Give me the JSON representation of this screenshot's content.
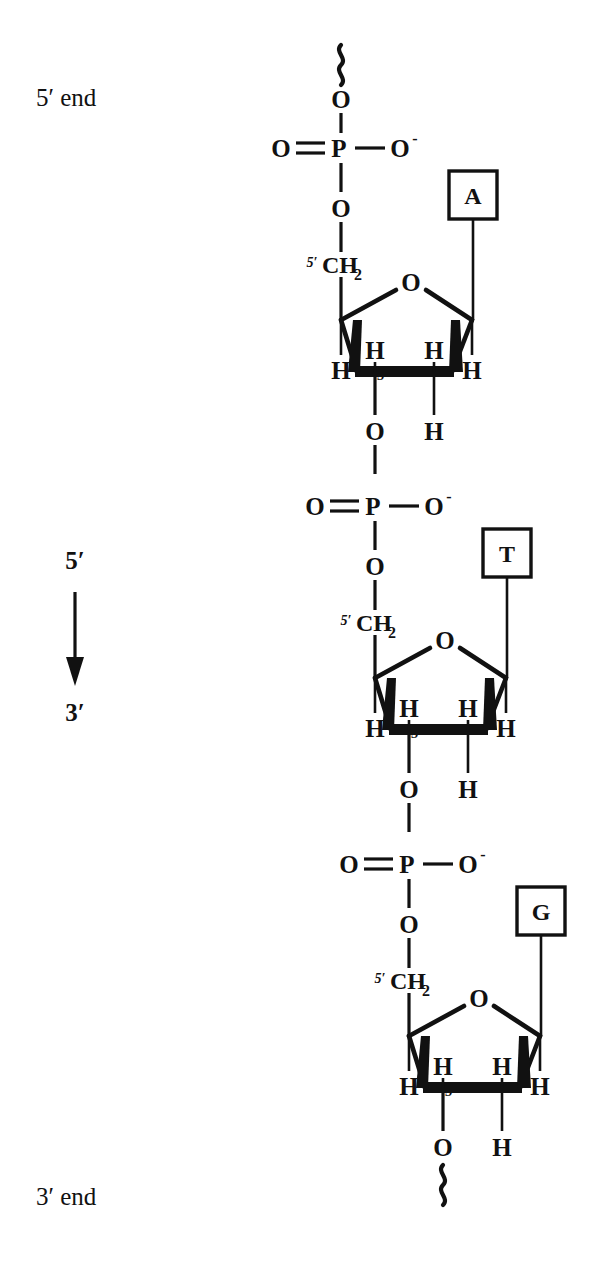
{
  "figure": {
    "kind": "dna-single-strand-backbone-diagram",
    "title_text": "",
    "ink_color": "#111111",
    "background_color": "#ffffff"
  },
  "labels": {
    "five_prime_end": "5′ end",
    "three_prime_end": "3′ end",
    "direction_top": "5′",
    "direction_bottom": "3′"
  },
  "atoms": {
    "oxygen": "O",
    "phosphorus": "P",
    "hydrogen": "H",
    "oxygen_anion": "O",
    "anion_charge": "-",
    "carbon_ch2": "CH",
    "ch2_subscript": "2",
    "prime_five": "5′",
    "prime_three": "3′"
  },
  "nucleotides": [
    {
      "index": 1,
      "base": "A",
      "base_name": "adenine",
      "phosphate": {
        "center": "P",
        "double_bond_oxygen": "O",
        "anionic_oxygen": "O",
        "anionic_charge": "-",
        "bridging_oxygen_top": "O",
        "bridging_oxygen_bottom": "O"
      },
      "sugar": {
        "name": "deoxyribose",
        "ring_oxygen": "O",
        "c5_label": "5′",
        "c5_group": "CH",
        "c5_subscript": "2",
        "c3_label": "3′",
        "hydrogens": [
          "H",
          "H",
          "H",
          "H",
          "H"
        ],
        "three_prime_oxygen": "O"
      },
      "terminus": "5′ end",
      "has_top_squiggle": true
    },
    {
      "index": 2,
      "base": "T",
      "base_name": "thymine",
      "phosphate": {
        "center": "P",
        "double_bond_oxygen": "O",
        "anionic_oxygen": "O",
        "anionic_charge": "-",
        "bridging_oxygen_top": "O",
        "bridging_oxygen_bottom": "O"
      },
      "sugar": {
        "name": "deoxyribose",
        "ring_oxygen": "O",
        "c5_label": "5′",
        "c5_group": "CH",
        "c5_subscript": "2",
        "c3_label": "3′",
        "hydrogens": [
          "H",
          "H",
          "H",
          "H",
          "H"
        ],
        "three_prime_oxygen": "O"
      },
      "terminus": "",
      "has_top_squiggle": false
    },
    {
      "index": 3,
      "base": "G",
      "base_name": "guanine",
      "phosphate": {
        "center": "P",
        "double_bond_oxygen": "O",
        "anionic_oxygen": "O",
        "anionic_charge": "-",
        "bridging_oxygen_top": "O",
        "bridging_oxygen_bottom": "O"
      },
      "sugar": {
        "name": "deoxyribose",
        "ring_oxygen": "O",
        "c5_label": "5′",
        "c5_group": "CH",
        "c5_subscript": "2",
        "c3_label": "3′",
        "hydrogens": [
          "H",
          "H",
          "H",
          "H",
          "H"
        ],
        "three_prime_oxygen": "O"
      },
      "terminus": "3′ end",
      "has_bottom_squiggle": true
    }
  ]
}
